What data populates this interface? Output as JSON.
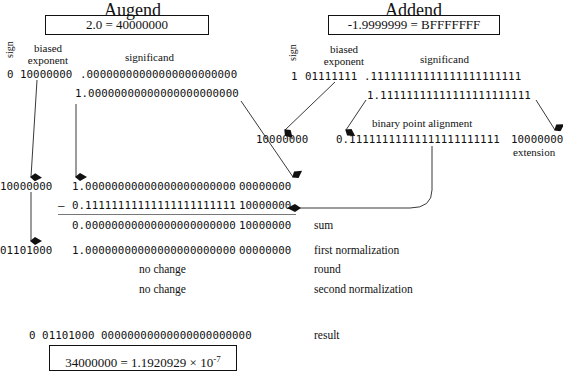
{
  "augend": {
    "title": "Augend",
    "value_box": "2.0 = 40000000",
    "sign_label": "sign",
    "exponent_label_1": "biased",
    "exponent_label_2": "exponent",
    "significand_label": "significand",
    "sign": "0",
    "exponent": "10000000",
    "fraction": ".00000000000000000000000",
    "significand_with_hidden": "1.00000000000000000000000"
  },
  "addend": {
    "title": "Addend",
    "value_box": "-1.9999999 = BFFFFFFF",
    "sign_label": "sign",
    "exponent_label_1": "biased",
    "exponent_label_2": "exponent",
    "significand_label": "significand",
    "sign": "1",
    "exponent": "01111111",
    "fraction": ".11111111111111111111111",
    "significand_with_hidden": "1.11111111111111111111111",
    "aligned_exponent": "10000000",
    "aligned_significand": "0.11111111111111111111111",
    "extension": "10000000",
    "alignment_label": "binary point alignment",
    "extension_label": "extension"
  },
  "computation": {
    "row1": {
      "exponent": "10000000",
      "significand": "1.00000000000000000000000",
      "extension": "00000000"
    },
    "row2": {
      "operator": "–",
      "significand": "0.11111111111111111111111",
      "extension": "10000000"
    },
    "row3": {
      "significand": "0.00000000000000000000000",
      "extension": "10000000",
      "label": "sum"
    },
    "row4": {
      "exponent": "01101000",
      "significand": "1.00000000000000000000000",
      "extension": "00000000",
      "label": "first normalization"
    },
    "row5": {
      "note": "no change",
      "label": "round"
    },
    "row6": {
      "note": "no change",
      "label": "second normalization"
    }
  },
  "result": {
    "bits": "0 01101000 00000000000000000000000",
    "label": "result",
    "box_main": "34000000 = 1.1920929 × 10",
    "box_exponent": "-7"
  }
}
